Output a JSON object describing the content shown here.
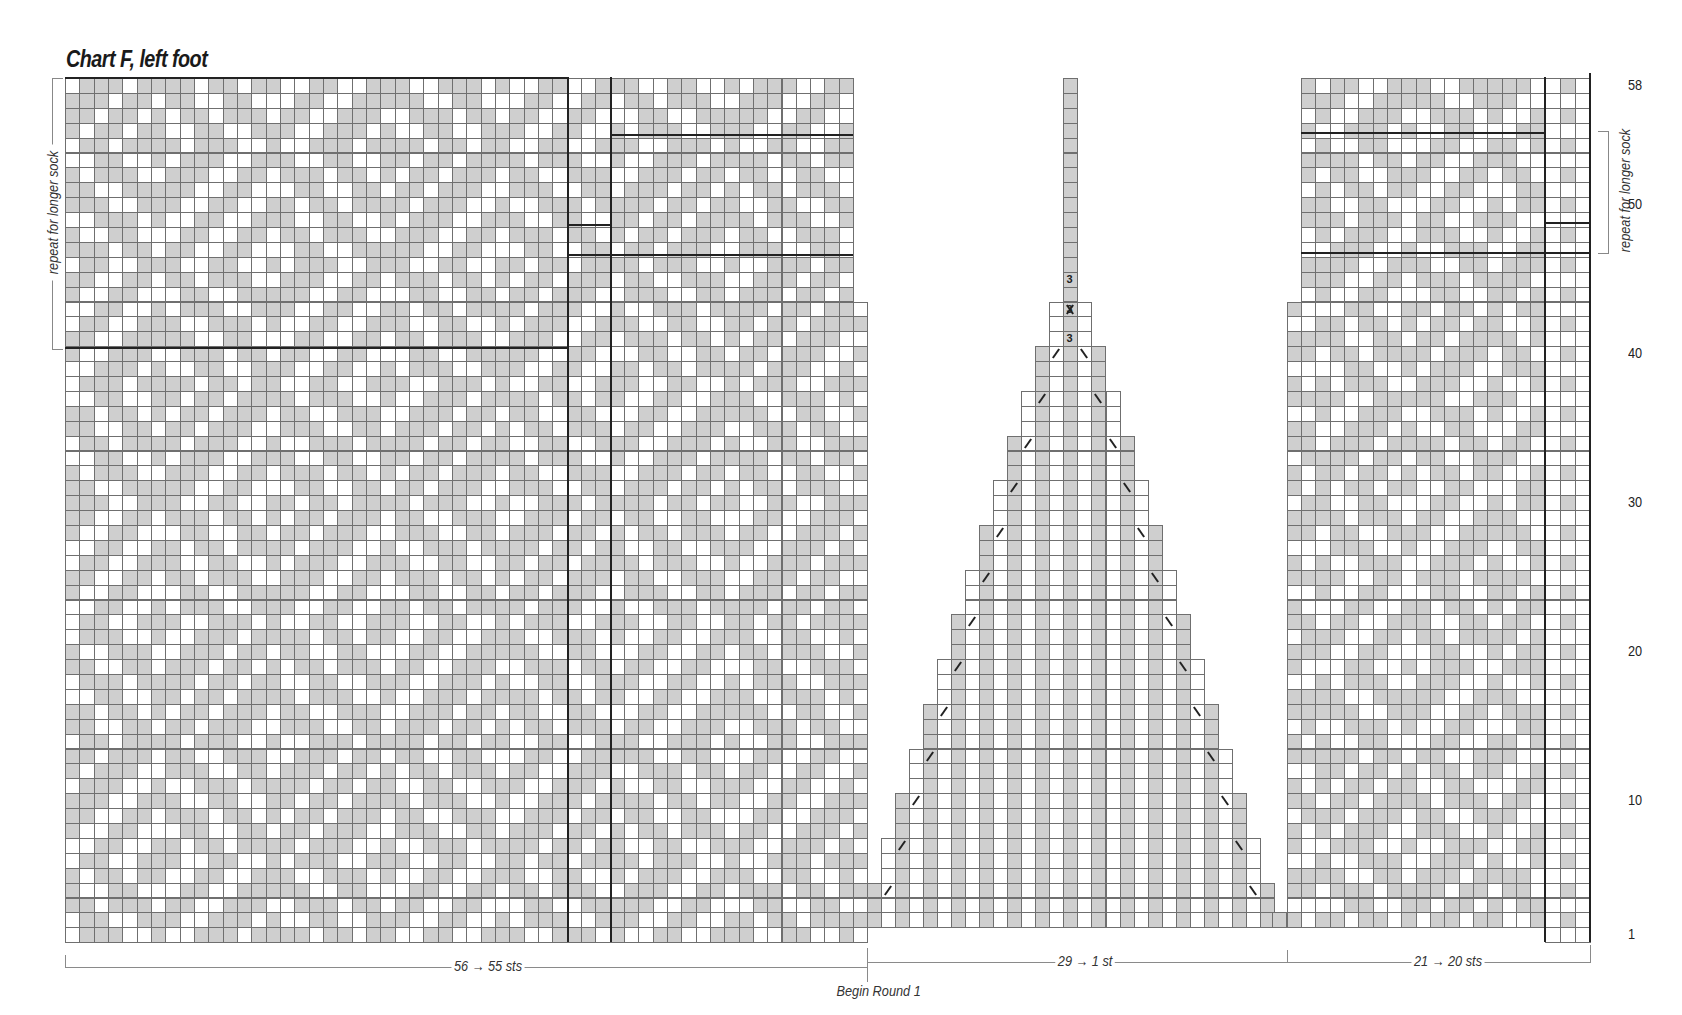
{
  "title": "Chart F, left foot",
  "chart_data": {
    "type": "table",
    "title": "Chart F, left foot",
    "rows_total": 58,
    "row_labels": [
      "1",
      "10",
      "20",
      "30",
      "40",
      "50",
      "58"
    ],
    "sections": [
      {
        "name": "instep",
        "stitches_label": "56 → 55 sts",
        "cols": 56
      },
      {
        "name": "gusset-triangle",
        "stitches_label": "29 → 1 st",
        "cols": 29
      },
      {
        "name": "sole-side",
        "stitches_label": "21 → 20 sts",
        "cols": 21
      }
    ],
    "annotations": [
      "repeat for longer sock",
      "repeat for longer sock",
      "Begin Round 1"
    ],
    "symbols": {
      "gray": "contrast color",
      "white": "main color",
      "/": "k2tog",
      "\\": "ssk",
      "3": "3-st decrease"
    },
    "colors": {
      "contrast": "#cfcfcf",
      "main": "#ffffff",
      "gridline": "#6f6f6f",
      "bold_line": "#222222"
    }
  },
  "labels": {
    "left_repeat": "repeat for longer sock",
    "right_repeat": "repeat for longer sock",
    "sts_left": "56 → 55 sts",
    "sts_mid": "29 → 1 st",
    "sts_right": "21 → 20 sts",
    "begin_round": "Begin Round 1"
  },
  "row_numbers": [
    {
      "label": "58",
      "row": 58
    },
    {
      "label": "50",
      "row": 50
    },
    {
      "label": "40",
      "row": 40
    },
    {
      "label": "30",
      "row": 30
    },
    {
      "label": "20",
      "row": 20
    },
    {
      "label": "10",
      "row": 10
    },
    {
      "label": "1",
      "row": 1
    }
  ],
  "decrease_mark": "3"
}
